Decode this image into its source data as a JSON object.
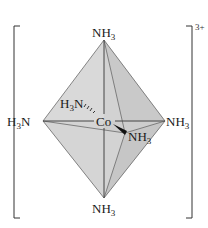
{
  "figure": {
    "central_atom": "Co",
    "charge": "3+",
    "ligands": [
      {
        "position": "top",
        "label": "NH",
        "sub": "3"
      },
      {
        "position": "left",
        "label_pre": "H",
        "sub": "3",
        "label_post": "N"
      },
      {
        "position": "right",
        "label": "NH",
        "sub": "3"
      },
      {
        "position": "bottom",
        "label": "NH",
        "sub": "3"
      },
      {
        "position": "back",
        "label_pre": "H",
        "sub": "3",
        "label_post": "N",
        "bond": "hashed"
      },
      {
        "position": "front",
        "label": "NH",
        "sub": "3",
        "bond": "wedge"
      }
    ],
    "colors": {
      "face_light": "#dcdcdc",
      "face_mid": "#cfcfcf",
      "face_dark": "#c4c4c4",
      "edge": "#555555",
      "bracket": "#333333"
    }
  }
}
